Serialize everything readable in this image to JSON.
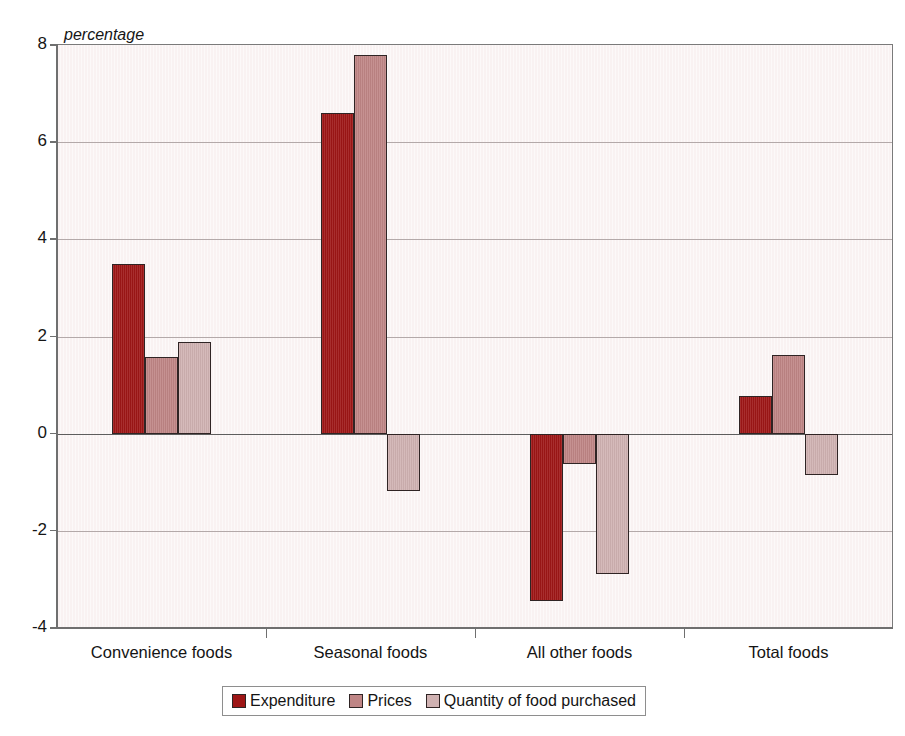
{
  "chart_data": {
    "type": "bar",
    "title": "",
    "subtitle": "",
    "axis_note": "percentage",
    "xlabel": "",
    "ylabel": "percentage",
    "categories": [
      "Convenience foods",
      "Seasonal foods",
      "All other foods",
      "Total foods"
    ],
    "series": [
      {
        "name": "Expenditure",
        "color": "#9e1616",
        "values": [
          3.5,
          6.6,
          -3.45,
          0.78
        ]
      },
      {
        "name": "Prices",
        "color": "#bf8585",
        "values": [
          1.58,
          7.8,
          -0.62,
          1.62
        ]
      },
      {
        "name": "Quantity of food purchased",
        "color": "#d0b2b2",
        "values": [
          1.88,
          -1.18,
          -2.88,
          -0.85
        ]
      }
    ],
    "ylim": [
      -4,
      8
    ],
    "yticks": [
      "8",
      "6",
      "4",
      "2",
      "0",
      "-2",
      "-4"
    ],
    "ytick_values": [
      8,
      6,
      4,
      2,
      0,
      -2,
      -4
    ],
    "grid": true,
    "grid_axis": "y",
    "legend_position": "bottom",
    "plot_background": "#f9f2f2",
    "gridline_color": "#b3a9a9",
    "axis_color": "#6f6f6f",
    "bar_border_color": "#2f2424"
  }
}
